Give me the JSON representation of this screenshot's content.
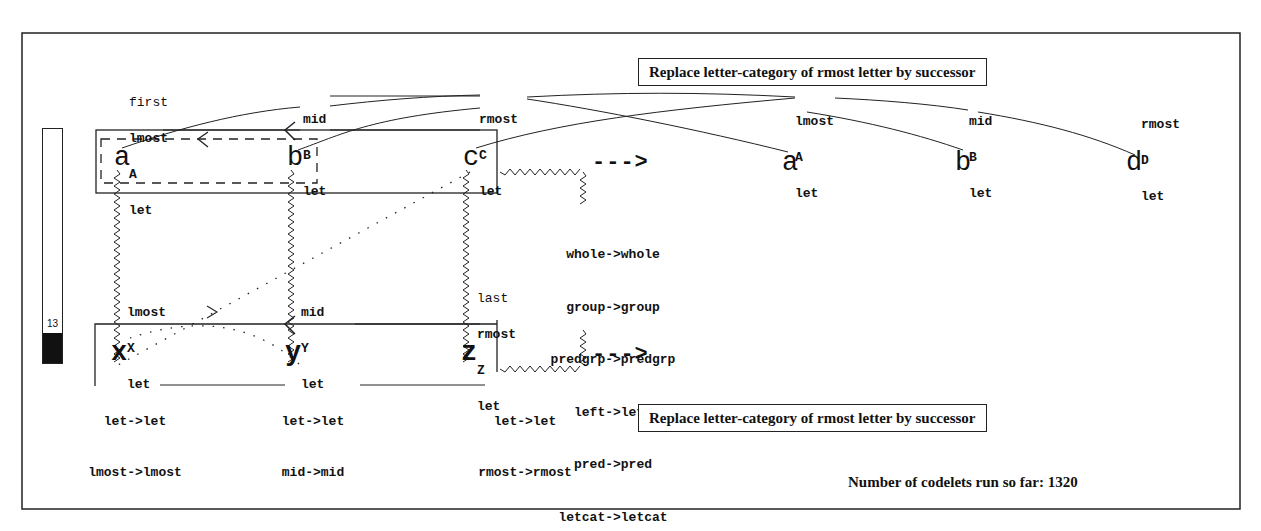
{
  "frame": {
    "border_color": "#222222",
    "background": "#ffffff"
  },
  "temperature": {
    "value": "13",
    "fill_percent": 13
  },
  "initial_string": {
    "letters": [
      "a",
      "b",
      "c"
    ],
    "descriptions": [
      [
        "first",
        "lmost",
        "A",
        "let"
      ],
      [
        "mid",
        "B",
        "let"
      ],
      [
        "rmost",
        "C",
        "let"
      ]
    ]
  },
  "modified_string": {
    "letters": [
      "a",
      "b",
      "d"
    ],
    "descriptions": [
      [
        "lmost",
        "A",
        "let"
      ],
      [
        "mid",
        "B",
        "let"
      ],
      [
        "rmost",
        "D",
        "let"
      ]
    ]
  },
  "target_string": {
    "letters": [
      "x",
      "y",
      "z"
    ],
    "descriptions": [
      [
        "lmost",
        "X",
        "let"
      ],
      [
        "mid",
        "Y",
        "let"
      ],
      [
        "last",
        "rmost",
        "Z",
        "let"
      ]
    ]
  },
  "arrow_glyph": "--->",
  "group_mappings": [
    "whole->whole",
    "group->group",
    "predgrp->predgrp",
    "left->left",
    "pred->pred",
    "letcat->letcat"
  ],
  "bond_mappings": [
    [
      "let->let",
      "lmost->lmost"
    ],
    [
      "let->let",
      "mid->mid"
    ],
    [
      "let->let",
      "rmost->rmost"
    ]
  ],
  "top_rule": "Replace letter-category of rmost letter by successor",
  "bottom_rule": "Replace letter-category of rmost letter by successor",
  "status": "Number of codelets run so far: 1320"
}
